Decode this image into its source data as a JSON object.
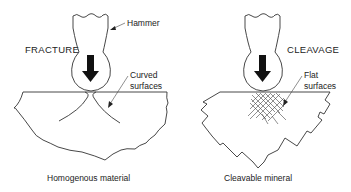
{
  "left_panel": {
    "title": "FRACTURE",
    "hammer_label": "Hammer",
    "surface_label_line1": "Curved",
    "surface_label_line2": "surfaces",
    "caption": "Homogenous material"
  },
  "right_panel": {
    "title": "CLEAVAGE",
    "surface_label_line1": "Flat",
    "surface_label_line2": "surfaces",
    "caption": "Cleavable mineral"
  },
  "colors": {
    "line": "#333333",
    "arrow": "#111111",
    "background": "#ffffff"
  }
}
